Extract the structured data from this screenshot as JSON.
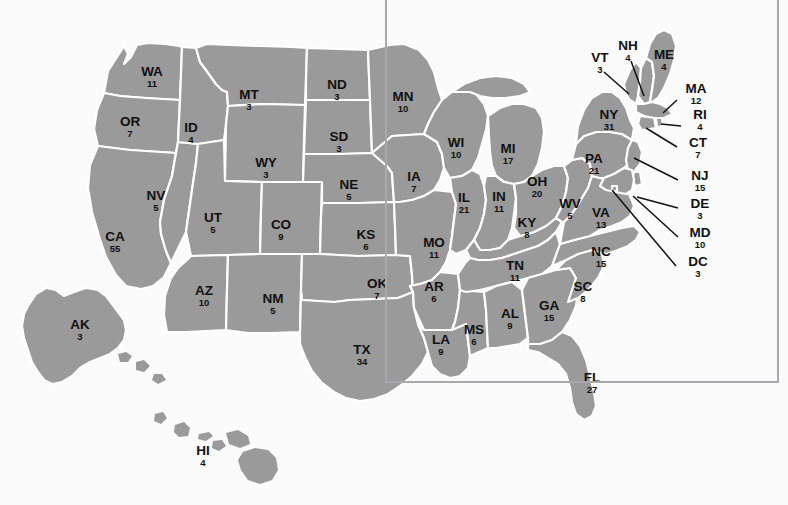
{
  "colors": {
    "background": "#fbfbfb",
    "state_fill": "#9a9a9a",
    "state_border": "#ffffff",
    "label_text": "#111111",
    "frame_border": "#a9a9ad",
    "leader_line": "#111111"
  },
  "chart_data": {
    "type": "map",
    "units": "electoral votes",
    "total_votes": 538,
    "categories": [
      "AL",
      "AK",
      "AZ",
      "AR",
      "CA",
      "CO",
      "CT",
      "DE",
      "DC",
      "FL",
      "GA",
      "HI",
      "ID",
      "IL",
      "IN",
      "IA",
      "KS",
      "KY",
      "LA",
      "ME",
      "MD",
      "MA",
      "MI",
      "MN",
      "MS",
      "MO",
      "MT",
      "NE",
      "NV",
      "NH",
      "NJ",
      "NM",
      "NY",
      "NC",
      "ND",
      "OH",
      "OK",
      "OR",
      "PA",
      "RI",
      "SC",
      "SD",
      "TN",
      "TX",
      "UT",
      "VT",
      "VA",
      "WA",
      "WV",
      "WI",
      "WY"
    ],
    "values": [
      9,
      3,
      10,
      6,
      55,
      9,
      7,
      3,
      3,
      27,
      15,
      4,
      4,
      21,
      11,
      7,
      6,
      8,
      9,
      4,
      10,
      12,
      17,
      10,
      6,
      11,
      3,
      5,
      5,
      4,
      15,
      5,
      31,
      15,
      3,
      20,
      7,
      7,
      21,
      4,
      8,
      3,
      11,
      34,
      5,
      3,
      13,
      11,
      5,
      10,
      3
    ]
  },
  "states": [
    {
      "abbr": "WA",
      "votes": "11",
      "lx": 152,
      "ly": 76
    },
    {
      "abbr": "OR",
      "votes": "7",
      "lx": 130,
      "ly": 126
    },
    {
      "abbr": "CA",
      "votes": "55",
      "lx": 115,
      "ly": 241
    },
    {
      "abbr": "NV",
      "votes": "5",
      "lx": 156,
      "ly": 200
    },
    {
      "abbr": "ID",
      "votes": "4",
      "lx": 191,
      "ly": 132
    },
    {
      "abbr": "MT",
      "votes": "3",
      "lx": 249,
      "ly": 99
    },
    {
      "abbr": "WY",
      "votes": "3",
      "lx": 266,
      "ly": 167
    },
    {
      "abbr": "UT",
      "votes": "5",
      "lx": 213,
      "ly": 222
    },
    {
      "abbr": "AZ",
      "votes": "10",
      "lx": 204,
      "ly": 295
    },
    {
      "abbr": "CO",
      "votes": "9",
      "lx": 281,
      "ly": 229
    },
    {
      "abbr": "NM",
      "votes": "5",
      "lx": 273,
      "ly": 303
    },
    {
      "abbr": "ND",
      "votes": "3",
      "lx": 337,
      "ly": 89
    },
    {
      "abbr": "SD",
      "votes": "3",
      "lx": 339,
      "ly": 141
    },
    {
      "abbr": "NE",
      "votes": "5",
      "lx": 349,
      "ly": 189
    },
    {
      "abbr": "KS",
      "votes": "6",
      "lx": 366,
      "ly": 239
    },
    {
      "abbr": "OK",
      "votes": "7",
      "lx": 377,
      "ly": 288
    },
    {
      "abbr": "TX",
      "votes": "34",
      "lx": 362,
      "ly": 354
    },
    {
      "abbr": "MN",
      "votes": "10",
      "lx": 403,
      "ly": 101
    },
    {
      "abbr": "IA",
      "votes": "7",
      "lx": 414,
      "ly": 181
    },
    {
      "abbr": "MO",
      "votes": "11",
      "lx": 434,
      "ly": 247
    },
    {
      "abbr": "AR",
      "votes": "6",
      "lx": 434,
      "ly": 291
    },
    {
      "abbr": "LA",
      "votes": "9",
      "lx": 441,
      "ly": 344
    },
    {
      "abbr": "WI",
      "votes": "10",
      "lx": 456,
      "ly": 147
    },
    {
      "abbr": "IL",
      "votes": "21",
      "lx": 464,
      "ly": 202
    },
    {
      "abbr": "MS",
      "votes": "6",
      "lx": 474,
      "ly": 334
    },
    {
      "abbr": "MI",
      "votes": "17",
      "lx": 508,
      "ly": 153
    },
    {
      "abbr": "IN",
      "votes": "11",
      "lx": 499,
      "ly": 201
    },
    {
      "abbr": "KY",
      "votes": "8",
      "lx": 527,
      "ly": 227
    },
    {
      "abbr": "TN",
      "votes": "11",
      "lx": 515,
      "ly": 270
    },
    {
      "abbr": "AL",
      "votes": "9",
      "lx": 510,
      "ly": 318
    },
    {
      "abbr": "OH",
      "votes": "20",
      "lx": 537,
      "ly": 186
    },
    {
      "abbr": "GA",
      "votes": "15",
      "lx": 549,
      "ly": 310
    },
    {
      "abbr": "FL",
      "votes": "27",
      "lx": 592,
      "ly": 382
    },
    {
      "abbr": "SC",
      "votes": "8",
      "lx": 583,
      "ly": 291
    },
    {
      "abbr": "NC",
      "votes": "15",
      "lx": 601,
      "ly": 256
    },
    {
      "abbr": "WV",
      "votes": "5",
      "lx": 570,
      "ly": 208
    },
    {
      "abbr": "VA",
      "votes": "13",
      "lx": 601,
      "ly": 217
    },
    {
      "abbr": "PA",
      "votes": "21",
      "lx": 594,
      "ly": 163
    },
    {
      "abbr": "NY",
      "votes": "31",
      "lx": 609,
      "ly": 119
    },
    {
      "abbr": "VT",
      "votes": "3",
      "lx": 600,
      "ly": 62
    },
    {
      "abbr": "NH",
      "votes": "4",
      "lx": 628,
      "ly": 50
    },
    {
      "abbr": "ME",
      "votes": "4",
      "lx": 664,
      "ly": 59
    },
    {
      "abbr": "MA",
      "votes": "12",
      "lx": 696,
      "ly": 93
    },
    {
      "abbr": "RI",
      "votes": "4",
      "lx": 700,
      "ly": 119
    },
    {
      "abbr": "CT",
      "votes": "7",
      "lx": 698,
      "ly": 147
    },
    {
      "abbr": "NJ",
      "votes": "15",
      "lx": 700,
      "ly": 180
    },
    {
      "abbr": "DE",
      "votes": "3",
      "lx": 700,
      "ly": 208
    },
    {
      "abbr": "MD",
      "votes": "10",
      "lx": 700,
      "ly": 237
    },
    {
      "abbr": "DC",
      "votes": "3",
      "lx": 698,
      "ly": 266
    },
    {
      "abbr": "AK",
      "votes": "3",
      "lx": 80,
      "ly": 329
    },
    {
      "abbr": "HI",
      "votes": "4",
      "lx": 203,
      "ly": 455
    }
  ]
}
